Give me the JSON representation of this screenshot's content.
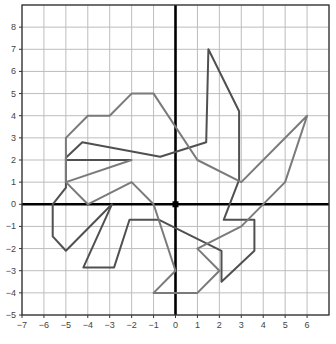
{
  "chart_data": {
    "type": "scatter",
    "title": "",
    "xlabel": "",
    "ylabel": "",
    "xlim": [
      -7,
      7
    ],
    "ylim": [
      -5,
      9
    ],
    "grid": true,
    "x_ticks": [
      -7,
      -6,
      -5,
      -4,
      -3,
      -2,
      -1,
      0,
      1,
      2,
      3,
      4,
      5,
      6
    ],
    "y_ticks": [
      -5,
      -4,
      -3,
      -2,
      -1,
      0,
      1,
      2,
      3,
      4,
      5,
      6,
      7,
      8
    ],
    "x_tick_labels": [
      "−7",
      "−6",
      "−5",
      "−4",
      "−3",
      "−2",
      "−1",
      "0",
      "1",
      "2",
      "3",
      "4",
      "5",
      "6"
    ],
    "y_tick_labels": [
      "−5",
      "−4",
      "−3",
      "−2",
      "−1",
      "0",
      "1",
      "2",
      "3",
      "4",
      "5",
      "6",
      "7",
      "8"
    ],
    "origin_marker": [
      0,
      0
    ],
    "series": [
      {
        "name": "dark-figure",
        "color": "#505050",
        "closed": true,
        "points": [
          [
            -5,
            0.75
          ],
          [
            -5,
            2.1
          ],
          [
            -4.25,
            2.8
          ],
          [
            -0.7,
            2.15
          ],
          [
            1.4,
            2.8
          ],
          [
            1.5,
            7
          ],
          [
            2.9,
            4.2
          ],
          [
            2.9,
            1.1
          ],
          [
            2.2,
            -0.7
          ],
          [
            3.6,
            -0.7
          ],
          [
            3.6,
            -2.1
          ],
          [
            2.1,
            -3.5
          ],
          [
            2.1,
            -2.1
          ],
          [
            -0.75,
            -0.7
          ],
          [
            -2.1,
            -0.7
          ],
          [
            -2.8,
            -2.85
          ],
          [
            -4.2,
            -2.85
          ],
          [
            -2.9,
            0
          ],
          [
            -5,
            -2.1
          ],
          [
            -5.6,
            -1.45
          ],
          [
            -5.6,
            0
          ],
          [
            -5,
            0.75
          ]
        ]
      },
      {
        "name": "dark-segment",
        "color": "#505050",
        "closed": false,
        "points": [
          [
            -5,
            2
          ],
          [
            -2,
            2
          ]
        ]
      },
      {
        "name": "light-figure",
        "color": "#7a7a7a",
        "closed": true,
        "points": [
          [
            -5,
            3
          ],
          [
            -4,
            4
          ],
          [
            -3,
            4
          ],
          [
            -2,
            5
          ],
          [
            -1,
            5
          ],
          [
            1,
            2
          ],
          [
            3,
            1
          ],
          [
            6,
            4
          ],
          [
            5,
            1
          ],
          [
            3,
            -1
          ],
          [
            1,
            -2
          ],
          [
            2,
            -3
          ],
          [
            1,
            -4
          ],
          [
            -1,
            -4
          ],
          [
            0,
            -3
          ],
          [
            -1,
            0
          ],
          [
            -2,
            1
          ],
          [
            -4,
            0
          ],
          [
            -5,
            1
          ],
          [
            -2,
            2
          ],
          [
            -5,
            1
          ],
          [
            -5,
            3
          ]
        ]
      }
    ]
  }
}
